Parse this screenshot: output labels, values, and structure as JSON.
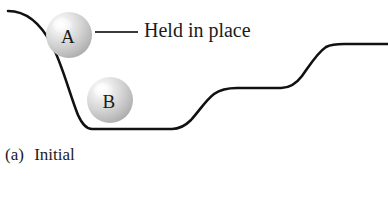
{
  "figure": {
    "caption_label": "(a)",
    "caption_text": "Initial",
    "annotation": "Held in place",
    "background_color": "#ffffff",
    "curve_color": "#111111",
    "leader_color": "#3a3a3a"
  },
  "balls": [
    {
      "id": "ball-a",
      "label": "A",
      "center_x": 69,
      "center_y": 35,
      "radius": 23,
      "state": "held in place on slope",
      "fill_style": "grey sphere with upper-left highlight"
    },
    {
      "id": "ball-b",
      "label": "B",
      "center_x": 110,
      "center_y": 100,
      "radius": 23,
      "state": "resting at valley floor",
      "fill_style": "grey sphere with upper-left highlight"
    }
  ],
  "terrain": {
    "description": "Descending slope into a flat valley, then two rising steps to an upper plateau",
    "stroke_width": 2.6,
    "path": "M 8,11 C 26,11 40,22 52,45 C 62,64 70,95 78,115 C 82,124 86,129 92,129 L 172,129 C 180,129 185,126 191,120 C 200,110 206,100 214,94 C 221,89 229,88 237,88 L 281,88 C 290,88 296,84 302,76 C 310,65 317,53 326,47 C 332,44 338,44 344,44 L 388,44",
    "key_points": [
      {
        "name": "left-crest",
        "x": 8,
        "y": 11
      },
      {
        "name": "valley-floor-left",
        "x": 92,
        "y": 129
      },
      {
        "name": "valley-floor-right",
        "x": 172,
        "y": 129
      },
      {
        "name": "mid-plateau-left",
        "x": 237,
        "y": 88
      },
      {
        "name": "mid-plateau-right",
        "x": 281,
        "y": 88
      },
      {
        "name": "upper-plateau-left",
        "x": 344,
        "y": 44
      },
      {
        "name": "upper-plateau-right",
        "x": 388,
        "y": 44
      }
    ]
  },
  "leader": {
    "start_x": 95,
    "end_x": 138,
    "y": 32
  }
}
